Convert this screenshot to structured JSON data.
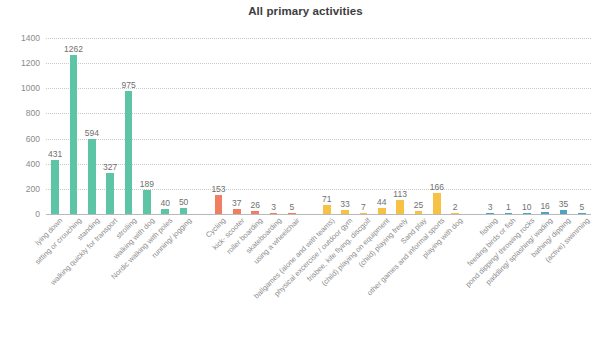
{
  "chart_data": {
    "type": "bar",
    "title": "All primary activities",
    "xlabel": "",
    "ylabel": "",
    "ylim": [
      0,
      1400
    ],
    "yticks": [
      0,
      200,
      400,
      600,
      800,
      1000,
      1200,
      1400
    ],
    "grid": true,
    "legend": "none",
    "categories": [
      "lying down",
      "sitting or crouching",
      "standing",
      "walking quickly for transport",
      "strolling",
      "walking with dog",
      "Nordic walking with poles",
      "running/ jogging",
      "Cycling",
      "kick- scooter",
      "roller boarding",
      "skateboarding",
      "using a wheelchair",
      "ballgames (alone and with teams)",
      "physical excercise / outdoor gym",
      "frisbee, kite flying, discgolf",
      "(child) playing on equipment",
      "(child) playing freely",
      "Sand play",
      "other games and informal sports",
      "playing with dog",
      "fishing",
      "feeding birds or fish",
      "pond dipping/ throwing rocks",
      "paddling/ splashing/ wading",
      "bathing/ dipping",
      "(active) swimming"
    ],
    "values": [
      431,
      1262,
      594,
      327,
      975,
      189,
      40,
      50,
      153,
      37,
      26,
      3,
      5,
      71,
      33,
      7,
      44,
      113,
      25,
      166,
      2,
      3,
      1,
      10,
      16,
      35,
      5
    ],
    "group_colors": [
      "#5ec4a6",
      "#5ec4a6",
      "#5ec4a6",
      "#5ec4a6",
      "#5ec4a6",
      "#5ec4a6",
      "#5ec4a6",
      "#5ec4a6",
      "#ef7e62",
      "#ef7e62",
      "#ef7e62",
      "#ef7e62",
      "#ef7e62",
      "#f7c244",
      "#f7c244",
      "#f7c244",
      "#f7c244",
      "#f7c244",
      "#f7c244",
      "#f7c244",
      "#f7c244",
      "#4ea3c4",
      "#4ea3c4",
      "#4ea3c4",
      "#4ea3c4",
      "#4ea3c4",
      "#4ea3c4"
    ],
    "groups": [
      {
        "name": "travel-and-posture",
        "color": "#5ec4a6",
        "start": 0,
        "count": 8
      },
      {
        "name": "wheeled-activities",
        "color": "#ef7e62",
        "start": 8,
        "count": 5
      },
      {
        "name": "play-and-sport",
        "color": "#f7c244",
        "start": 13,
        "count": 8
      },
      {
        "name": "water-activities",
        "color": "#4ea3c4",
        "start": 21,
        "count": 6
      }
    ],
    "group_gaps_before": [
      8,
      13,
      21
    ],
    "colors": {
      "teal": "#5ec4a6",
      "salmon": "#ef7e62",
      "yellow": "#f7c244",
      "blue": "#4ea3c4",
      "grid": "#c9c9c9",
      "axis": "#b9b9b9",
      "tick_text": "#8a8a8a",
      "value_text": "#6f6f6f",
      "label_text": "#8c8c8c",
      "title_text": "#3d3d3d",
      "background": "#ffffff"
    }
  }
}
